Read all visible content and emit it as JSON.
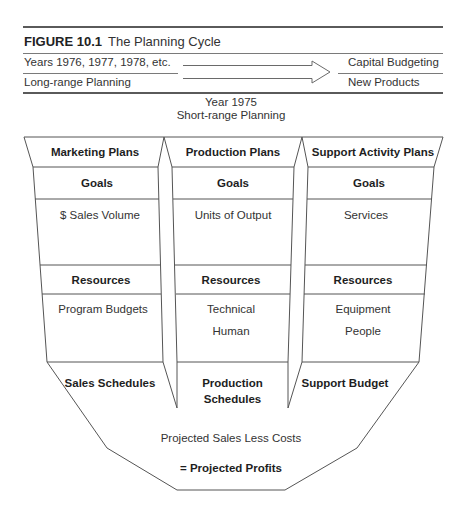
{
  "figure": {
    "number": "FIGURE 10.1",
    "title": "The Planning Cycle"
  },
  "long_range": {
    "years_label": "Years 1976, 1977, 1978, etc.",
    "planning_label": "Long-range Planning",
    "outputs": [
      "Capital Budgeting",
      "New Products"
    ],
    "arrow": "right-arrow-icon"
  },
  "short_range": {
    "year_label": "Year 1975",
    "planning_label": "Short-range Planning"
  },
  "columns": [
    {
      "header": "Marketing Plans",
      "goals_label": "Goals",
      "goals": [
        "$ Sales Volume"
      ],
      "resources_label": "Resources",
      "resources": [
        "Program Budgets"
      ],
      "output": "Sales Schedules"
    },
    {
      "header": "Production Plans",
      "goals_label": "Goals",
      "goals": [
        "Units of Output"
      ],
      "resources_label": "Resources",
      "resources": [
        "Technical",
        "Human"
      ],
      "output": "Production Schedules",
      "output_lines": [
        "Production",
        "Schedules"
      ]
    },
    {
      "header": "Support Activity Plans",
      "goals_label": "Goals",
      "goals": [
        "Services"
      ],
      "resources_label": "Resources",
      "resources": [
        "Equipment",
        "People"
      ],
      "output": "Support Budget"
    }
  ],
  "result": {
    "line1": "Projected Sales Less Costs",
    "line2": "= Projected Profits"
  }
}
